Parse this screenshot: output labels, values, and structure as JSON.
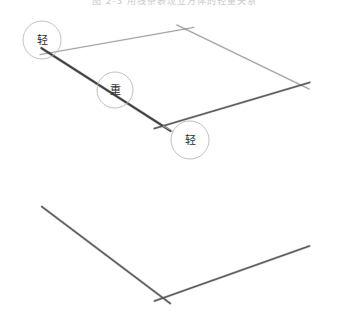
{
  "figure": {
    "caption": "图 2-3  用线条表现立方体的轻重关系",
    "background_color": "#ffffff",
    "line_color_heavy": "#3a3a3a",
    "line_color_medium": "#55555b",
    "line_color_light": "#8d8d93",
    "circle_color": "#b9b9bd",
    "label_color": "#2b2b2b"
  },
  "annotations": [
    {
      "id": "annot-top-left",
      "text": "轻",
      "cx": 42,
      "cy": 40,
      "r": 19,
      "anchor_x": 49,
      "anchor_y": 53
    },
    {
      "id": "annot-middle",
      "text": "重",
      "cx": 115,
      "cy": 90,
      "r": 18,
      "anchor_x": 115,
      "anchor_y": 90
    },
    {
      "id": "annot-center-front",
      "text": "轻",
      "cx": 190,
      "cy": 140,
      "r": 19,
      "anchor_x": 163,
      "anchor_y": 126
    }
  ],
  "cube": {
    "vertices": {
      "top_left": {
        "x": 49,
        "y": 53
      },
      "top_back": {
        "x": 185,
        "y": 29
      },
      "top_right": {
        "x": 301,
        "y": 85
      },
      "center_front": {
        "x": 163,
        "y": 126
      },
      "bottom_left": {
        "x": 49,
        "y": 212
      },
      "bottom_front": {
        "x": 163,
        "y": 298
      },
      "bottom_right": {
        "x": 301,
        "y": 249
      }
    },
    "edges": [
      {
        "name": "top-left-to-top-back",
        "from": "top_left",
        "to": "top_back",
        "weight": "light",
        "width": 1.0
      },
      {
        "name": "top-back-to-top-right",
        "from": "top_back",
        "to": "top_right",
        "weight": "light",
        "width": 1.1
      },
      {
        "name": "top-left-to-center-front",
        "from": "top_left",
        "to": "center_front",
        "weight": "heavy",
        "width": 2.1
      },
      {
        "name": "center-front-to-top-right",
        "from": "center_front",
        "to": "top_right",
        "weight": "medium",
        "width": 1.6
      },
      {
        "name": "left-vertical",
        "from": "top_left",
        "to": "bottom_left",
        "weight": "light",
        "width": 0.9
      },
      {
        "name": "center-vertical",
        "from": "center_front",
        "to": "bottom_front",
        "weight": "light",
        "width": 0.9
      },
      {
        "name": "right-vertical",
        "from": "top_right",
        "to": "bottom_right",
        "weight": "light",
        "width": 0.9
      },
      {
        "name": "bottom-left-to-bottom-front",
        "from": "bottom_left",
        "to": "bottom_front",
        "weight": "medium",
        "width": 1.7
      },
      {
        "name": "bottom-front-to-bottom-right",
        "from": "bottom_front",
        "to": "bottom_right",
        "weight": "medium",
        "width": 1.6
      }
    ],
    "overshoot_px": 9
  }
}
